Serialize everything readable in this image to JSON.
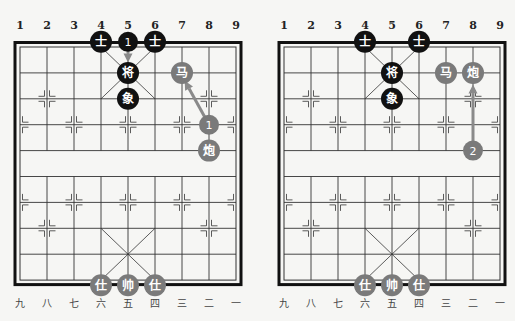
{
  "colors": {
    "background": "#f6f6f4",
    "grid": "#333333",
    "border": "#111111",
    "black_piece": "#111111",
    "red_piece": "#7a7a7a",
    "arrow": "#8a8a8a",
    "piece_text": "#ffffff"
  },
  "geometry": {
    "col_spacing": 27,
    "row_spacing": 25.9,
    "piece_radius": 11
  },
  "boards": [
    {
      "id": "diagram-1",
      "origin_x": 20,
      "origin_y": 47,
      "top_labels": [
        "1",
        "2",
        "3",
        "4",
        "5",
        "6",
        "7",
        "8",
        "9"
      ],
      "bottom_labels": [
        "九",
        "八",
        "七",
        "六",
        "五",
        "四",
        "三",
        "二",
        "一"
      ],
      "pieces": [
        {
          "side": "black",
          "char": "士",
          "col": 3,
          "row": -0.2
        },
        {
          "side": "black",
          "char": "士",
          "col": 5,
          "row": -0.2
        },
        {
          "side": "black",
          "char": "将",
          "col": 4,
          "row": 1
        },
        {
          "side": "black",
          "char": "象",
          "col": 4,
          "row": 2
        },
        {
          "side": "red",
          "char": "马",
          "col": 6,
          "row": 1
        },
        {
          "side": "red",
          "char": "炮",
          "col": 7,
          "row": 4
        },
        {
          "side": "red",
          "char": "仕",
          "col": 3,
          "row": 9.2
        },
        {
          "side": "red",
          "char": "帅",
          "col": 4,
          "row": 9.2
        },
        {
          "side": "red",
          "char": "仕",
          "col": 5,
          "row": 9.2
        }
      ],
      "markers": [
        {
          "label": "1",
          "side": "black",
          "col": 4,
          "row": -0.2
        },
        {
          "label": "1",
          "side": "red",
          "col": 7,
          "row": 3
        }
      ],
      "arrows": [
        {
          "from_col": 4,
          "from_row": -0.2,
          "to_col": 4,
          "to_row": 0.6
        },
        {
          "from_col": 7,
          "from_row": 3,
          "to_col": 6.1,
          "to_row": 1.3
        }
      ]
    },
    {
      "id": "diagram-2",
      "origin_x": 284,
      "origin_y": 47,
      "top_labels": [
        "1",
        "2",
        "3",
        "4",
        "5",
        "6",
        "7",
        "8",
        "9"
      ],
      "bottom_labels": [
        "九",
        "八",
        "七",
        "六",
        "五",
        "四",
        "三",
        "二",
        "一"
      ],
      "pieces": [
        {
          "side": "black",
          "char": "士",
          "col": 3,
          "row": -0.2
        },
        {
          "side": "black",
          "char": "士",
          "col": 5,
          "row": -0.2
        },
        {
          "side": "black",
          "char": "将",
          "col": 4,
          "row": 1
        },
        {
          "side": "black",
          "char": "象",
          "col": 4,
          "row": 2
        },
        {
          "side": "red",
          "char": "马",
          "col": 6,
          "row": 1
        },
        {
          "side": "red",
          "char": "炮",
          "col": 7,
          "row": 1
        },
        {
          "side": "red",
          "char": "仕",
          "col": 3,
          "row": 9.2
        },
        {
          "side": "red",
          "char": "帅",
          "col": 4,
          "row": 9.2
        },
        {
          "side": "red",
          "char": "仕",
          "col": 5,
          "row": 9.2
        }
      ],
      "markers": [
        {
          "label": "2",
          "side": "red",
          "col": 7,
          "row": 4
        }
      ],
      "arrows": [
        {
          "from_col": 7,
          "from_row": 4,
          "to_col": 7,
          "to_row": 1.45
        }
      ]
    }
  ]
}
